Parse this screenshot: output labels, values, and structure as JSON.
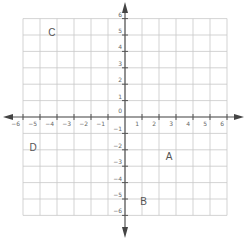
{
  "diagram": {
    "type": "coordinate-plane",
    "x_range": [
      -6,
      6
    ],
    "y_range": [
      -6,
      6
    ],
    "grid": true,
    "colors": {
      "grid": "#c8c8c8",
      "axis": "#555555",
      "label": "#555555"
    },
    "x_tick_labels": [
      "-6",
      "-5",
      "-4",
      "-3",
      "-2",
      "-1",
      "1",
      "2",
      "3",
      "4",
      "5",
      "6"
    ],
    "y_tick_labels": [
      "6",
      "5",
      "4",
      "3",
      "2",
      "1",
      "0",
      "-1",
      "-2",
      "-3",
      "-4",
      "-5",
      "-6"
    ],
    "points": [
      {
        "label": "A",
        "x": 2.6,
        "y": -2.4
      },
      {
        "label": "B",
        "x": 1.1,
        "y": -5.1
      },
      {
        "label": "C",
        "x": -4.3,
        "y": 5.2
      },
      {
        "label": "D",
        "x": -5.4,
        "y": -1.8
      }
    ]
  }
}
